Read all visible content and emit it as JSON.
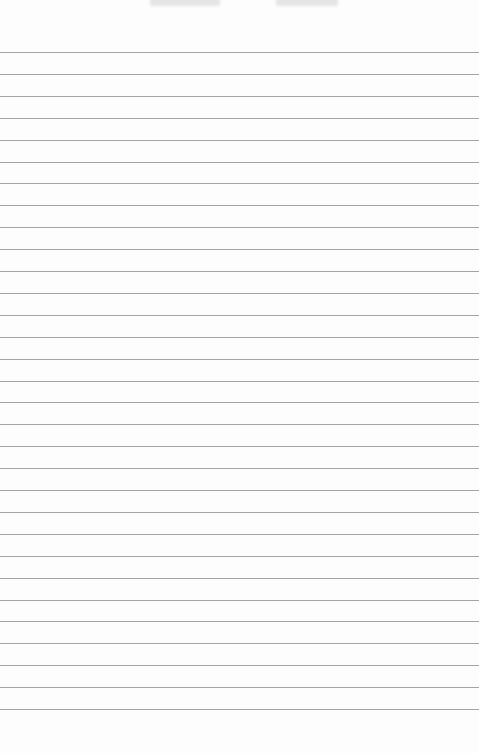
{
  "page": {
    "type": "lined-paper",
    "background_color": "#fdfdfd",
    "line_color": "#a4a4a4",
    "line_count": 31,
    "first_line_y": 52,
    "line_spacing": 21.9,
    "header_text": [
      "",
      ""
    ]
  }
}
